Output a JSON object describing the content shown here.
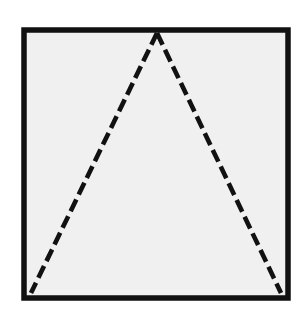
{
  "canvas": {
    "width": 303,
    "height": 316,
    "background_color": "#ffffff"
  },
  "figure": {
    "square": {
      "name": "square-frame",
      "x": 24,
      "y": 30,
      "width": 264,
      "height": 268,
      "stroke_color": "#111111",
      "stroke_width": 5.5,
      "fill_color": "#f0f0f0",
      "line_style": "solid"
    },
    "triangle": {
      "name": "dashed-triangle",
      "apex": {
        "x": 157,
        "y": 33
      },
      "base_left": {
        "x": 31,
        "y": 293
      },
      "base_right": {
        "x": 281,
        "y": 293
      },
      "stroke_color": "#111111",
      "stroke_width": 4.6,
      "line_style": "dashed",
      "dash_length": 13,
      "dash_gap": 5.5,
      "fill_color": "none",
      "base_drawn": false,
      "legs": [
        {
          "name": "left-leg",
          "from": {
            "x": 157,
            "y": 33
          },
          "to": {
            "x": 31,
            "y": 293
          }
        },
        {
          "name": "right-leg",
          "from": {
            "x": 157,
            "y": 33
          },
          "to": {
            "x": 281,
            "y": 293
          }
        }
      ]
    }
  }
}
